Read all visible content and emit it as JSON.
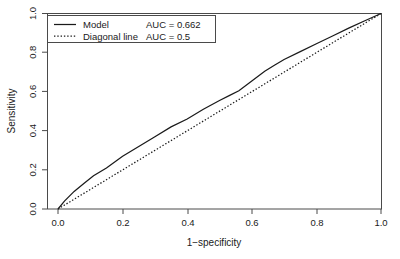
{
  "chart_data": {
    "type": "line",
    "title": "",
    "xlabel": "1−specificity",
    "ylabel": "Sensitivity",
    "xlim": [
      0,
      1
    ],
    "ylim": [
      0,
      1
    ],
    "grid": false,
    "x_ticks": [
      "0.0",
      "0.2",
      "0.4",
      "0.6",
      "0.8",
      "1.0"
    ],
    "x_tick_values": [
      0.0,
      0.2,
      0.4,
      0.6,
      0.8,
      1.0
    ],
    "y_ticks": [
      "0.0",
      "0.2",
      "0.4",
      "0.6",
      "0.8",
      "1.0"
    ],
    "y_tick_values": [
      0.0,
      0.2,
      0.4,
      0.6,
      0.8,
      1.0
    ],
    "legend_position": "top-left",
    "series": [
      {
        "name": "Model",
        "style": "solid",
        "auc_label": "AUC = 0.662",
        "auc": 0.662,
        "x": [
          0.0,
          0.02,
          0.05,
          0.08,
          0.11,
          0.15,
          0.2,
          0.25,
          0.3,
          0.35,
          0.4,
          0.45,
          0.5,
          0.53,
          0.56,
          0.6,
          0.64,
          0.67,
          0.7,
          0.75,
          0.8,
          0.85,
          0.9,
          0.95,
          1.0
        ],
        "y": [
          0.0,
          0.04,
          0.09,
          0.13,
          0.17,
          0.21,
          0.27,
          0.32,
          0.37,
          0.42,
          0.46,
          0.51,
          0.555,
          0.58,
          0.605,
          0.655,
          0.705,
          0.735,
          0.765,
          0.805,
          0.845,
          0.885,
          0.925,
          0.963,
          1.0
        ]
      },
      {
        "name": "Diagonal line",
        "style": "dotted",
        "auc_label": "AUC = 0.5",
        "auc": 0.5,
        "x": [
          0.0,
          1.0
        ],
        "y": [
          0.0,
          1.0
        ]
      }
    ]
  },
  "legend": {
    "entries": [
      {
        "label": "Model",
        "auc_label": "AUC = 0.662"
      },
      {
        "label": "Diagonal line",
        "auc_label": "AUC = 0.5"
      }
    ]
  },
  "colors": {
    "background": "#ffffff",
    "axis": "#4a4a4a",
    "series": "#1a1a1a",
    "text": "#1a1a1a"
  }
}
